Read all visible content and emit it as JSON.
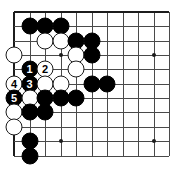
{
  "diagram": {
    "kind": "go-board-diagram",
    "board": {
      "cols": 11,
      "rows": 11,
      "origin_x": 14,
      "origin_y": 12,
      "spacing_x": 15.5,
      "spacing_y": 14.35,
      "line_color": "#4a4a4a",
      "edge_color": "#1c1c1c",
      "background_color": "#ffffff"
    },
    "star_points": [
      {
        "col": 3,
        "row": 3
      },
      {
        "col": 9,
        "row": 3
      },
      {
        "col": 3,
        "row": 9
      },
      {
        "col": 9,
        "row": 9
      }
    ],
    "stone_colors": {
      "black": "#000000",
      "white": "#ffffff",
      "white_outline": "#1a1a1a",
      "black_label": "#ffffff",
      "white_label": "#000000"
    },
    "stones": [
      {
        "col": 1,
        "row": 1,
        "color": "black",
        "label": ""
      },
      {
        "col": 2,
        "row": 1,
        "color": "black",
        "label": ""
      },
      {
        "col": 3,
        "row": 1,
        "color": "black",
        "label": ""
      },
      {
        "col": 2,
        "row": 2,
        "color": "white",
        "label": ""
      },
      {
        "col": 3,
        "row": 2,
        "color": "white",
        "label": ""
      },
      {
        "col": 4,
        "row": 2,
        "color": "black",
        "label": ""
      },
      {
        "col": 5,
        "row": 2,
        "color": "black",
        "label": ""
      },
      {
        "col": 0,
        "row": 3,
        "color": "white",
        "label": ""
      },
      {
        "col": 4,
        "row": 3,
        "color": "white",
        "label": ""
      },
      {
        "col": 5,
        "row": 3,
        "color": "black",
        "label": ""
      },
      {
        "col": 1,
        "row": 4,
        "color": "black",
        "label": "1"
      },
      {
        "col": 2,
        "row": 4,
        "color": "white",
        "label": "2"
      },
      {
        "col": 4,
        "row": 4,
        "color": "white",
        "label": ""
      },
      {
        "col": 0,
        "row": 5,
        "color": "white",
        "label": "4"
      },
      {
        "col": 1,
        "row": 5,
        "color": "black",
        "label": "3"
      },
      {
        "col": 2,
        "row": 5,
        "color": "white",
        "label": ""
      },
      {
        "col": 3,
        "row": 5,
        "color": "white",
        "label": ""
      },
      {
        "col": 5,
        "row": 5,
        "color": "black",
        "label": ""
      },
      {
        "col": 6,
        "row": 5,
        "color": "black",
        "label": ""
      },
      {
        "col": 0,
        "row": 6,
        "color": "black",
        "label": "5"
      },
      {
        "col": 1,
        "row": 6,
        "color": "white",
        "label": ""
      },
      {
        "col": 2,
        "row": 6,
        "color": "black",
        "label": ""
      },
      {
        "col": 3,
        "row": 6,
        "color": "black",
        "label": ""
      },
      {
        "col": 4,
        "row": 6,
        "color": "black",
        "label": ""
      },
      {
        "col": 0,
        "row": 7,
        "color": "white",
        "label": ""
      },
      {
        "col": 1,
        "row": 7,
        "color": "black",
        "label": ""
      },
      {
        "col": 2,
        "row": 7,
        "color": "black",
        "label": ""
      },
      {
        "col": 0,
        "row": 8,
        "color": "white",
        "label": ""
      },
      {
        "col": 1,
        "row": 9,
        "color": "black",
        "label": ""
      },
      {
        "col": 1,
        "row": 10,
        "color": "black",
        "label": ""
      }
    ],
    "move_labels": [
      "1",
      "2",
      "3",
      "4",
      "5"
    ]
  }
}
